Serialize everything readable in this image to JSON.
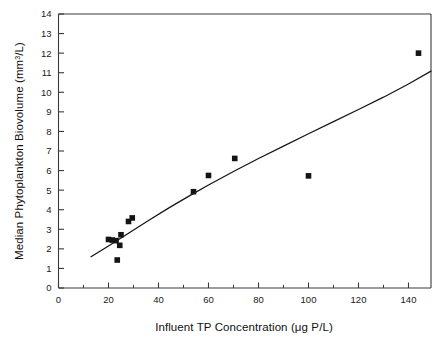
{
  "chart_data": {
    "type": "scatter",
    "title": "",
    "xlabel": "Influent TP Concentration (μ g P/L)",
    "xlabel_parts": {
      "text_before": "Influent TP Concentration (",
      "mu": "μ",
      "text_after": "g P/L)"
    },
    "ylabel": "Median Phytoplankton Biovolume (mm³/L)",
    "ylabel_parts": {
      "text_before": "Median Phytoplankton Biovolume (mm",
      "superscript": "3",
      "text_after": "/L)"
    },
    "xlim": [
      0,
      149
    ],
    "ylim": [
      0,
      14
    ],
    "xticks": [
      0,
      20,
      40,
      60,
      80,
      100,
      120,
      140
    ],
    "xticklabels": [
      "0",
      "20",
      "40",
      "60",
      "80",
      "100",
      "120",
      "140"
    ],
    "x_minor_ticks": [
      10,
      30,
      50,
      70,
      90,
      110,
      130
    ],
    "yticks": [
      0,
      1,
      2,
      3,
      4,
      5,
      6,
      7,
      8,
      9,
      10,
      11,
      12,
      13,
      14
    ],
    "yticklabels": [
      "0",
      "1",
      "2",
      "3",
      "4",
      "5",
      "6",
      "7",
      "8",
      "9",
      "10",
      "11",
      "12",
      "13",
      "14"
    ],
    "grid": false,
    "legend": false,
    "marker_style": "filled-square",
    "marker_color": "#141414",
    "line_color": "#151515",
    "frame_color": "#3a3a3a",
    "points": [
      {
        "x": 20.0,
        "y": 2.48
      },
      {
        "x": 21.5,
        "y": 2.45
      },
      {
        "x": 23.0,
        "y": 2.42
      },
      {
        "x": 23.5,
        "y": 1.43
      },
      {
        "x": 24.5,
        "y": 2.18
      },
      {
        "x": 25.0,
        "y": 2.72
      },
      {
        "x": 28.0,
        "y": 3.4
      },
      {
        "x": 29.5,
        "y": 3.58
      },
      {
        "x": 54.0,
        "y": 4.92
      },
      {
        "x": 60.0,
        "y": 5.75
      },
      {
        "x": 70.5,
        "y": 6.62
      },
      {
        "x": 100.0,
        "y": 5.73
      },
      {
        "x": 144.0,
        "y": 12.0
      }
    ],
    "fit_curve": [
      {
        "x": 13.0,
        "y": 1.6
      },
      {
        "x": 20.0,
        "y": 2.15
      },
      {
        "x": 28.0,
        "y": 2.8
      },
      {
        "x": 36.0,
        "y": 3.45
      },
      {
        "x": 44.0,
        "y": 4.08
      },
      {
        "x": 52.0,
        "y": 4.68
      },
      {
        "x": 60.0,
        "y": 5.26
      },
      {
        "x": 70.0,
        "y": 5.95
      },
      {
        "x": 80.0,
        "y": 6.62
      },
      {
        "x": 90.0,
        "y": 7.25
      },
      {
        "x": 100.0,
        "y": 7.88
      },
      {
        "x": 110.0,
        "y": 8.5
      },
      {
        "x": 120.0,
        "y": 9.12
      },
      {
        "x": 130.0,
        "y": 9.75
      },
      {
        "x": 140.0,
        "y": 10.42
      },
      {
        "x": 149.0,
        "y": 11.08
      }
    ]
  }
}
